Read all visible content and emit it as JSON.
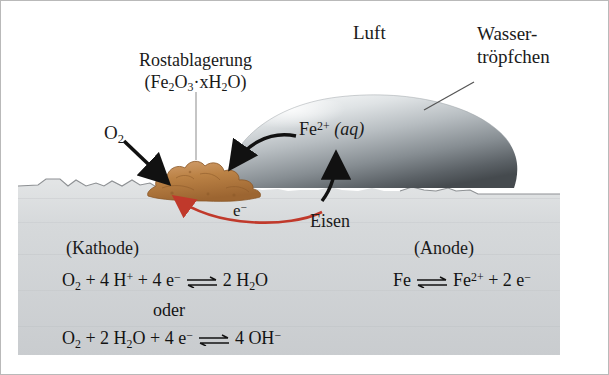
{
  "diagram": {
    "labels": {
      "air": "Luft",
      "rust_deposit": "Rostablagerung",
      "rust_formula_parts": {
        "open": "(Fe",
        "sub1": "2",
        "o": "O",
        "sub2": "3",
        "dot": "·",
        "x": "x",
        "h": "H",
        "sub3": "2",
        "o2": "O)",
        "full": "(Fe2O3·xH2O)"
      },
      "water_droplet_line1": "Wasser-",
      "water_droplet_line2": "tröpfchen",
      "oxygen": "O",
      "oxygen_sub": "2",
      "iron_ion": "Fe",
      "iron_ion_sup": "2+",
      "iron_ion_state": "(aq)",
      "iron": "Eisen",
      "electron": "e",
      "electron_sup": "−",
      "cathode": "(Kathode)",
      "anode": "(Anode)"
    },
    "equations": {
      "cathode_1": {
        "left": "O2 + 4 H+ + 4 e−",
        "right": "2 H2O",
        "parts_left": [
          "O",
          "2",
          " + 4 H",
          "+",
          " + 4 e",
          "−"
        ],
        "parts_right": [
          "2 H",
          "2",
          "O"
        ],
        "arrow": "equilibrium"
      },
      "connector": "oder",
      "cathode_2": {
        "left": "O2 + 2 H2O + 4 e−",
        "right": "4 OH−",
        "arrow": "equilibrium"
      },
      "anode_1": {
        "left": "Fe",
        "right": "Fe2+ + 2 e−",
        "arrow": "equilibrium"
      }
    },
    "colors": {
      "electron_arrow": "#c0392b",
      "rust_fill": "#c08a52",
      "rust_dark": "#a06a33",
      "metal_fill": "#d2d4d6",
      "droplet_light": "#f0f2f3",
      "droplet_dark": "#4e5459",
      "text": "#1a1a1a",
      "border": "#b9b9b9",
      "background": "#ffffff"
    },
    "icons": {
      "o2_arrow": "arrow-down-right",
      "fe2_arrow": "arrow-curved-left",
      "fe2_up_arrow": "arrow-curved-up",
      "electron_arc": "arrow-curved-left-red",
      "rust_leader": "leader-line-vertical",
      "droplet_leader": "leader-line-diagonal"
    }
  }
}
